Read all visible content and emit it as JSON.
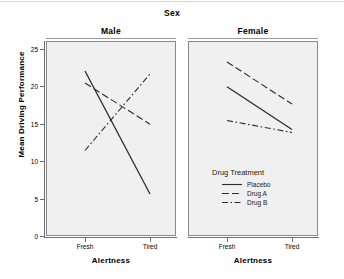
{
  "figure": {
    "header_title": "Sex",
    "y_axis_label": "Mean Driving Performance",
    "y_ticks": [
      "25",
      "20",
      "15",
      "10",
      "5",
      "0"
    ],
    "panels": [
      {
        "title": "Male",
        "x_axis_title": "Alertness",
        "x_ticks": [
          "Fresh",
          "Tired"
        ]
      },
      {
        "title": "Female",
        "x_axis_title": "Alertness",
        "x_ticks": [
          "Fresh",
          "Tired"
        ]
      }
    ]
  },
  "legend": {
    "title": "Drug Treatment",
    "entries": [
      {
        "label": "Placebo",
        "style": "solid"
      },
      {
        "label": "Drug A",
        "style": "dashed"
      },
      {
        "label": "Drug B",
        "style": "dashdot"
      }
    ]
  },
  "colors": {
    "line": "#2b2b2b",
    "panel_background": "#f0f0f0",
    "panel_border": "#8a8a8a",
    "axis": "#6e6e6e",
    "text": "#000000",
    "page_background": "#ffffff"
  },
  "chart_data": {
    "type": "line",
    "title": "Sex",
    "xlabel": "Alertness",
    "ylabel": "Mean Driving Performance",
    "ylim": [
      0,
      26
    ],
    "yticks": [
      0,
      5,
      10,
      15,
      20,
      25
    ],
    "categories": [
      "Fresh",
      "Tired"
    ],
    "grid": false,
    "legend": {
      "title": "Drug Treatment",
      "position": "inside-bottom-right-panel-2"
    },
    "panels": [
      {
        "name": "Male",
        "series": [
          {
            "name": "Placebo",
            "style": "solid",
            "values": [
              22.0,
              5.6
            ]
          },
          {
            "name": "Drug A",
            "style": "dashed",
            "values": [
              20.4,
              14.9
            ]
          },
          {
            "name": "Drug B",
            "style": "dashdot",
            "values": [
              11.4,
              21.6
            ]
          }
        ]
      },
      {
        "name": "Female",
        "series": [
          {
            "name": "Placebo",
            "style": "solid",
            "values": [
              19.9,
              14.2
            ]
          },
          {
            "name": "Drug A",
            "style": "dashed",
            "values": [
              23.2,
              17.6
            ]
          },
          {
            "name": "Drug B",
            "style": "dashdot",
            "values": [
              15.4,
              13.8
            ]
          }
        ]
      }
    ]
  }
}
